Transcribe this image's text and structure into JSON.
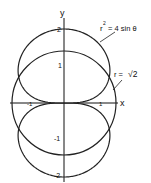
{
  "chart_data": {
    "type": "line",
    "title": "",
    "xlabel": "x",
    "ylabel": "y",
    "xlim": [
      -1.5,
      1.5
    ],
    "ylim": [
      -2.2,
      2.2
    ],
    "grid": false,
    "x_ticks": [
      {
        "value": -1,
        "label": "-1"
      },
      {
        "value": 1,
        "label": "1"
      }
    ],
    "y_ticks": [
      {
        "value": 2,
        "label": "2"
      },
      {
        "value": 1,
        "label": "1"
      },
      {
        "value": -1,
        "label": "-1"
      },
      {
        "value": -2,
        "label": "-2"
      }
    ],
    "series": [
      {
        "name": "r^2 = 4 sin θ",
        "kind": "polar-lemniscate",
        "equation": "r² = 4 sin θ"
      },
      {
        "name": "r = √2",
        "kind": "polar-circle",
        "equation": "r = √2",
        "radius": 1.41421
      }
    ],
    "annotations": [
      {
        "text": "r² = 4 sin θ",
        "target": "lemniscate"
      },
      {
        "text": "r = √2",
        "target": "circle"
      }
    ]
  },
  "labels": {
    "x_axis": "x",
    "y_axis": "y",
    "tick_x_neg1": "-1",
    "tick_x_pos1": "1",
    "tick_y_2": "2",
    "tick_y_1": "1",
    "tick_y_neg1": "-1",
    "tick_y_neg2": "-2",
    "curve1_r": "r",
    "curve1_sup": "2",
    "curve1_rest": "= 4 sin θ",
    "curve2_r": "r =",
    "curve2_sqrt": "√2"
  }
}
